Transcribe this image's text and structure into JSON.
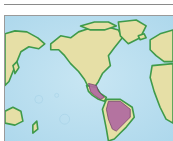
{
  "figure": {
    "type": "range-map",
    "projection": "world, centered on the Americas",
    "highlighted_region": "Mexico, Central America and much of South America",
    "colors": {
      "ocean": "#bfe0f0",
      "ocean_shallow": "#8fcbe6",
      "land": "#e6dfa6",
      "coast": "#3f9a4a",
      "highlight": "#b06aa0",
      "rule": "#8a8a8a",
      "frame_border": "#9a9a9a"
    }
  }
}
